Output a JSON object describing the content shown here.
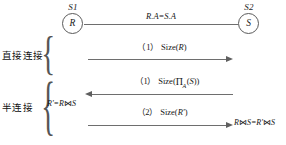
{
  "diagram": {
    "background_color": "#ffffff",
    "line_color": "#6e6e6e",
    "text_color": "#151515"
  },
  "nodes": [
    {
      "id": "s1",
      "site_label": "S1",
      "relation": "R"
    },
    {
      "id": "s2",
      "site_label": "S2",
      "relation": "S"
    }
  ],
  "top_edge": {
    "label": "R.A=S.A"
  },
  "categories": [
    {
      "id": "direct",
      "label": "直接连接"
    },
    {
      "id": "semi",
      "label": "半连接",
      "formula_prefix": "R'=R",
      "formula_join": "⋈",
      "formula_suffix": "S"
    }
  ],
  "messages": [
    {
      "id": "msg-1",
      "group": "direct",
      "seq": "（1）",
      "text": "Size(R)",
      "direction": "right",
      "arrowhead": true
    },
    {
      "id": "msg-2",
      "group": "semi",
      "seq": "（1）",
      "text": "Size(Π_A(S))",
      "direction": "left",
      "arrowhead": true
    },
    {
      "id": "msg-3",
      "group": "semi",
      "seq": "（2）",
      "text": "Size(R')",
      "direction": "right",
      "arrowhead": true
    }
  ],
  "result": {
    "label_left": "R",
    "join_symbol": "⋈",
    "label_mid": "S=R'",
    "join_symbol_2": "⋈",
    "label_right": "S",
    "full": "R⋈S=R'⋈S"
  },
  "symbols": {
    "pi": "Π",
    "subscript_a": "A",
    "bowtie": "⋈",
    "brace": "{"
  }
}
